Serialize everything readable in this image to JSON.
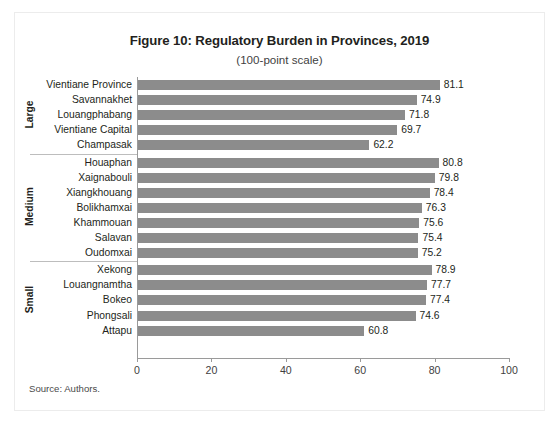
{
  "figure": {
    "title": "Figure 10: Regulatory Burden in Provinces, 2019",
    "subtitle": "(100-point scale)",
    "source": "Source: Authors."
  },
  "chart_data": {
    "type": "bar",
    "orientation": "horizontal",
    "title": "Figure 10: Regulatory Burden in Provinces, 2019",
    "subtitle": "(100-point scale)",
    "xlabel": "",
    "ylabel": "",
    "xlim": [
      0,
      100
    ],
    "xticks": [
      0,
      20,
      40,
      60,
      80,
      100
    ],
    "xtick_labels": [
      "0",
      "20",
      "40",
      "60",
      "80",
      "100"
    ],
    "grid": false,
    "legend": false,
    "bar_color": "#8c8c8c",
    "axis_color": "#9a9a9a",
    "groups": [
      {
        "name": "Large",
        "categories": [
          "Vientiane Province",
          "Savannakhet",
          "Louangphabang",
          "Vientiane Capital",
          "Champasak"
        ],
        "values": [
          81.1,
          74.9,
          71.8,
          69.7,
          62.2
        ],
        "value_labels": [
          "81.1",
          "74.9",
          "71.8",
          "69.7",
          "62.2"
        ]
      },
      {
        "name": "Medium",
        "categories": [
          "Houaphan",
          "Xaignabouli",
          "Xiangkhouang",
          "Bolikhamxai",
          "Khammouan",
          "Salavan",
          "Oudomxai"
        ],
        "values": [
          80.8,
          79.8,
          78.4,
          76.3,
          75.6,
          75.4,
          75.2
        ],
        "value_labels": [
          "80.8",
          "79.8",
          "78.4",
          "76.3",
          "75.6",
          "75.4",
          "75.2"
        ]
      },
      {
        "name": "Small",
        "categories": [
          "Xekong",
          "Louangnamtha",
          "Bokeo",
          "Phongsali",
          "Attapu"
        ],
        "values": [
          78.9,
          77.7,
          77.4,
          74.6,
          60.8
        ],
        "value_labels": [
          "78.9",
          "77.7",
          "77.4",
          "74.6",
          "60.8"
        ]
      }
    ]
  }
}
